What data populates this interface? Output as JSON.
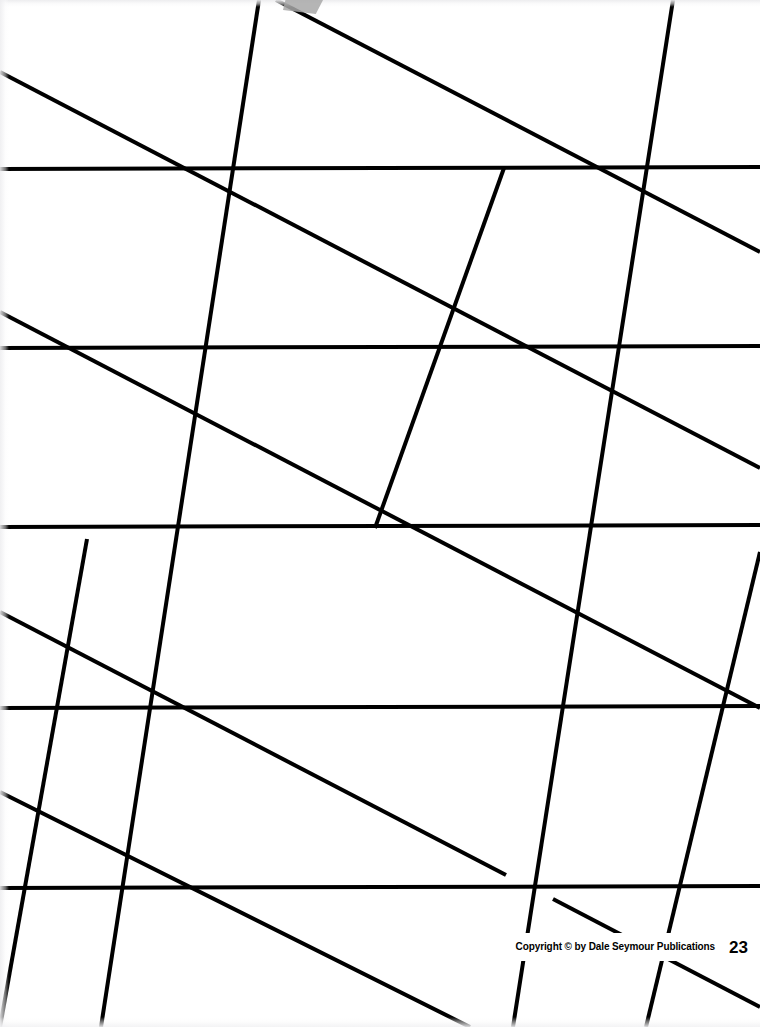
{
  "page": {
    "width": 760,
    "height": 1027,
    "background_color": "#ffffff",
    "line_color": "#000000"
  },
  "footer": {
    "copyright": "Copyright © by Dale Seymour Publications",
    "page_number": "23"
  },
  "artifacts": {
    "smudge_color": "#a8a8a8",
    "edge_tint": "#ececee"
  },
  "chart_data": {
    "type": "line",
    "xlabel": "",
    "ylabel": "",
    "xlim": [
      0,
      760
    ],
    "ylim": [
      0,
      1027
    ],
    "grid": true,
    "legend": "none",
    "stroke_width": 4,
    "stroke_color": "#000000",
    "vertices": [
      [
        68,
        348
      ],
      [
        172,
        168
      ],
      [
        172,
        888
      ],
      [
        375,
        528
      ],
      [
        575,
        168
      ],
      [
        680,
        708
      ]
    ],
    "series": [
      {
        "name": "near-horizontal family",
        "slope": -0.003,
        "left_edge_y": [
          169,
          348,
          527,
          708,
          888
        ],
        "segments": [
          [
            0,
            169,
            760,
            167
          ],
          [
            0,
            348,
            760,
            346
          ],
          [
            0,
            527,
            760,
            525
          ],
          [
            0,
            708,
            760,
            706
          ],
          [
            0,
            888,
            760,
            886
          ]
        ]
      },
      {
        "name": "descending family",
        "slope": 0.52,
        "segments": [
          [
            0,
            72,
            760,
            468
          ],
          [
            0,
            312,
            760,
            708
          ],
          [
            0,
            612,
            506,
            875
          ],
          [
            553,
            899,
            760,
            1007
          ],
          [
            0,
            792,
            470,
            1027
          ],
          [
            276,
            0,
            760,
            252
          ]
        ]
      },
      {
        "name": "ascending family",
        "slope": -2.22,
        "segments": [
          [
            259,
            0,
            101,
            1027
          ],
          [
            673,
            0,
            513,
            1027
          ],
          [
            87,
            539,
            0,
            1027
          ],
          [
            504,
            168,
            375,
            528
          ],
          [
            760,
            552,
            646,
            1027
          ]
        ]
      }
    ]
  }
}
